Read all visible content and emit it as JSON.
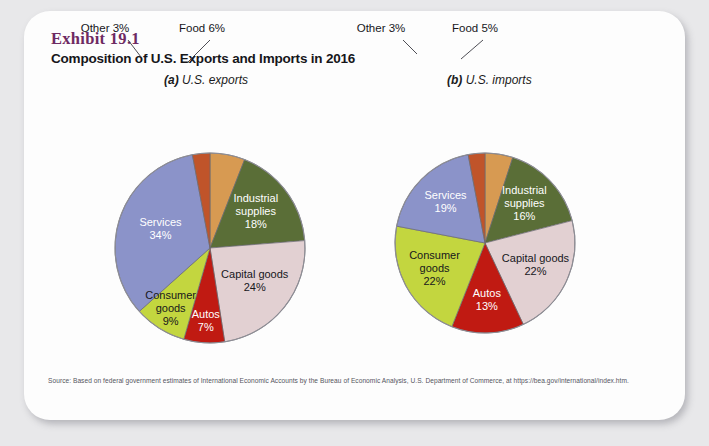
{
  "exhibit": {
    "number_label": "Exhibit 19.1",
    "title": "Composition of U.S. Exports and Imports in 2016"
  },
  "panels": {
    "a": {
      "prefix": "(a)",
      "subtitle": " U.S. exports"
    },
    "b": {
      "prefix": "(b)",
      "subtitle": " U.S. imports"
    }
  },
  "source": {
    "line1": "Source: Based on federal government estimates of International Economic Accounts by the Bureau of Economic Analysis, U.S. Department of Commerce, at",
    "line2": "https://bea.gov/international/index.htm."
  },
  "colors": {
    "services": "#8b93c9",
    "industrial_supplies": "#5a6e37",
    "capital_goods": "#e2d0d2",
    "consumer_goods": "#c3d63f",
    "autos": "#c01a12",
    "other": "#c0542a",
    "food": "#d79a52",
    "exhibit_purple": "#6e2a63"
  },
  "chart_data": [
    {
      "type": "pie",
      "title": "(a) U.S. exports",
      "id": "exports",
      "categories": [
        "Food",
        "Industrial supplies",
        "Capital goods",
        "Autos",
        "Consumer goods",
        "Services",
        "Other"
      ],
      "values": [
        6,
        18,
        24,
        7,
        9,
        34,
        3
      ],
      "unit": "percent",
      "start_angle_deg": 0,
      "direction": "clockwise",
      "labels": [
        {
          "name": "Food",
          "value": 6,
          "text": "Food 6%",
          "placement": "callout",
          "color": "#d79a52"
        },
        {
          "name": "Industrial supplies",
          "value": 18,
          "line1": "Industrial",
          "line2": "supplies",
          "line3": "18%",
          "placement": "inside",
          "color": "#5a6e37",
          "text_color": "light"
        },
        {
          "name": "Capital goods",
          "value": 24,
          "line1": "Capital goods",
          "line2": "24%",
          "placement": "inside",
          "color": "#e2d0d2",
          "text_color": "dark"
        },
        {
          "name": "Autos",
          "value": 7,
          "line1": "Autos",
          "line2": "7%",
          "placement": "inside",
          "color": "#c01a12",
          "text_color": "light"
        },
        {
          "name": "Consumer goods",
          "value": 9,
          "line1": "Consumer",
          "line2": "goods",
          "line3": "9%",
          "placement": "inside",
          "color": "#c3d63f",
          "text_color": "dark"
        },
        {
          "name": "Services",
          "value": 34,
          "line1": "Services",
          "line2": "34%",
          "placement": "inside",
          "color": "#8b93c9",
          "text_color": "light"
        },
        {
          "name": "Other",
          "value": 3,
          "text": "Other 3%",
          "placement": "callout",
          "color": "#c0542a"
        }
      ]
    },
    {
      "type": "pie",
      "title": "(b) U.S. imports",
      "id": "imports",
      "categories": [
        "Food",
        "Industrial supplies",
        "Capital goods",
        "Autos",
        "Consumer goods",
        "Services",
        "Other"
      ],
      "values": [
        5,
        16,
        22,
        13,
        22,
        19,
        3
      ],
      "unit": "percent",
      "start_angle_deg": 0,
      "direction": "clockwise",
      "labels": [
        {
          "name": "Food",
          "value": 5,
          "text": "Food 5%",
          "placement": "callout",
          "color": "#d79a52"
        },
        {
          "name": "Industrial supplies",
          "value": 16,
          "line1": "Industrial",
          "line2": "supplies",
          "line3": "16%",
          "placement": "inside",
          "color": "#5a6e37",
          "text_color": "light"
        },
        {
          "name": "Capital goods",
          "value": 22,
          "line1": "Capital goods",
          "line2": "22%",
          "placement": "inside",
          "color": "#e2d0d2",
          "text_color": "dark"
        },
        {
          "name": "Autos",
          "value": 13,
          "line1": "Autos",
          "line2": "13%",
          "placement": "inside",
          "color": "#c01a12",
          "text_color": "light"
        },
        {
          "name": "Consumer goods",
          "value": 22,
          "line1": "Consumer",
          "line2": "goods",
          "line3": "22%",
          "placement": "inside",
          "color": "#c3d63f",
          "text_color": "dark"
        },
        {
          "name": "Services",
          "value": 19,
          "line1": "Services",
          "line2": "19%",
          "placement": "inside",
          "color": "#8b93c9",
          "text_color": "light"
        },
        {
          "name": "Other",
          "value": 3,
          "text": "Other 3%",
          "placement": "callout",
          "color": "#c0542a"
        }
      ]
    }
  ]
}
